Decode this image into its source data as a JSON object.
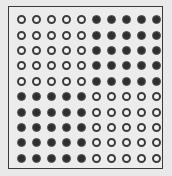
{
  "figure": {
    "rows": 10,
    "cols": 10,
    "colors": {
      "filled": "#2f2f2f",
      "hollow_stroke": "#3c3c3c",
      "background": "#e9e9e9",
      "frame": "#3a3a3a"
    },
    "pattern": [
      "oooooxxxxx",
      "oooooxxxxx",
      "oooooxxxxx",
      "oooooxxxxx",
      "oooooxxxxx",
      "xxxxxooooo",
      "xxxxxooooo",
      "xxxxxooooo",
      "xxxxxooooo",
      "xxxxxooooo"
    ],
    "legend": {
      "o": "hollow-circle",
      "x": "filled-circle"
    }
  }
}
